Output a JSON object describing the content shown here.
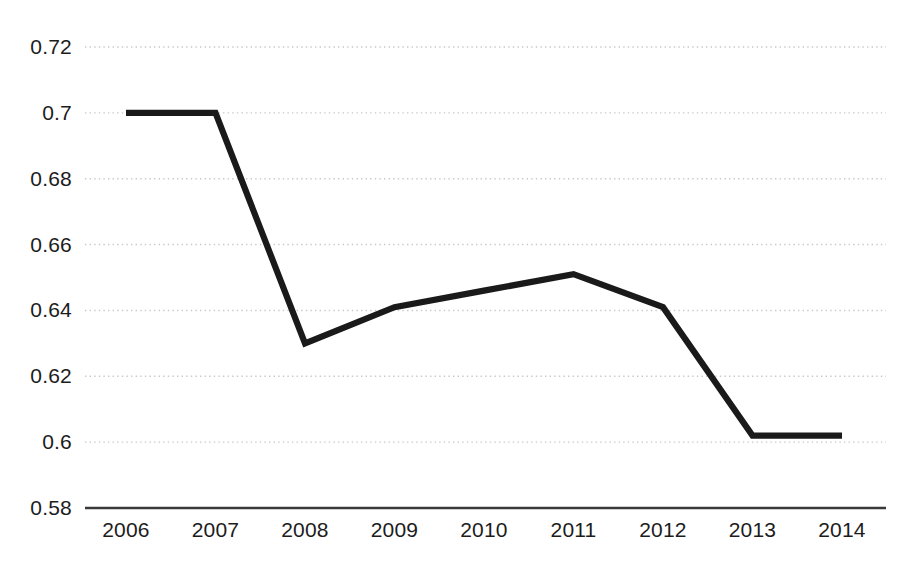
{
  "chart_data": {
    "type": "line",
    "title": "",
    "subtitle": "",
    "xlabel": "",
    "ylabel": "",
    "categories": [
      "2006",
      "2007",
      "2008",
      "2009",
      "2010",
      "2011",
      "2012",
      "2013",
      "2014"
    ],
    "values": [
      0.7,
      0.7,
      0.63,
      0.641,
      0.646,
      0.651,
      0.641,
      0.602,
      0.602
    ],
    "series": [
      {
        "name": "",
        "values": [
          0.7,
          0.7,
          0.63,
          0.641,
          0.646,
          0.651,
          0.641,
          0.602,
          0.602
        ]
      }
    ],
    "ylim": [
      0.58,
      0.72
    ],
    "y_ticks": [
      0.72,
      0.7,
      0.68,
      0.66,
      0.64,
      0.62,
      0.6,
      0.58
    ],
    "y_tick_labels": [
      "0.72",
      "0.7",
      "0.68",
      "0.66",
      "0.64",
      "0.62",
      "0.6",
      "0.58"
    ],
    "x_tick_labels": [
      "2006",
      "2007",
      "2008",
      "2009",
      "2010",
      "2011",
      "2012",
      "2013",
      "2014"
    ],
    "grid": true,
    "grid_style": "dotted",
    "legend": false,
    "legend_position": "none",
    "markers": false,
    "colors": {
      "line": "#1a1a1a",
      "grid": "#c9c9c9",
      "axis": "#3a3a3a",
      "background": "#ffffff",
      "tick_label": "#1c1c1c"
    }
  }
}
